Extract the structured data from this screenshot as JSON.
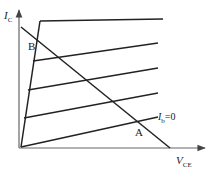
{
  "diagram": {
    "axes": {
      "y": {
        "symbol": "I",
        "subscript": "C"
      },
      "x": {
        "symbol": "V",
        "subscript": "CE"
      }
    },
    "curves_count": 5,
    "curve_label": {
      "symbol": "I",
      "subscript": "b",
      "suffix": "=0"
    },
    "points": {
      "A": "A",
      "B": "B"
    },
    "colors": {
      "line": "#222222",
      "axis": "#666666"
    }
  }
}
